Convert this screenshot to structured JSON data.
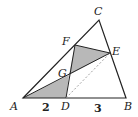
{
  "diagram": {
    "type": "geometry-triangle",
    "points": {
      "A": {
        "label": "A",
        "x": 23,
        "y": 98
      },
      "B": {
        "label": "B",
        "x": 126,
        "y": 98
      },
      "C": {
        "label": "C",
        "x": 99,
        "y": 20
      },
      "D": {
        "label": "D",
        "x": 66,
        "y": 98
      },
      "E": {
        "label": "E",
        "x": 110,
        "y": 53
      },
      "F": {
        "label": "F",
        "x": 75,
        "y": 45
      },
      "G": {
        "label": "G",
        "x": 69,
        "y": 75
      }
    },
    "segment_labels": {
      "AD": "2",
      "DB": "3"
    },
    "shaded_regions": [
      "triangle ADG",
      "triangle FGE"
    ],
    "dashed_segments": [
      "DE"
    ],
    "colors": {
      "stroke": "#222222",
      "shade": "#b8b8b8",
      "dashed": "#888888"
    }
  }
}
